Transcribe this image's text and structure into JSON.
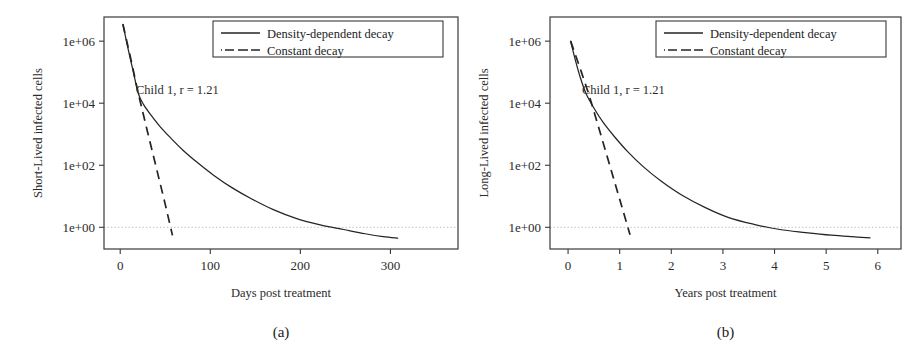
{
  "figure": {
    "background": "#ffffff",
    "ink": "#242424",
    "refline_color": "#b9b9b9"
  },
  "chart_data": [
    {
      "type": "line",
      "panel": "a",
      "caption": "(a)",
      "title": "",
      "xlabel": "Days post treatment",
      "ylabel": "Short-Lived infected cells",
      "annotation": "Child 1, r = 1.21",
      "yscale": "log",
      "ylim": [
        0.2,
        6000000
      ],
      "xlim": [
        -18,
        375
      ],
      "yticks": [
        1,
        100,
        10000,
        1000000
      ],
      "yticklabels": [
        "1e+00",
        "1e+02",
        "1e+04",
        "1e+06"
      ],
      "xticks": [
        0,
        100,
        200,
        300
      ],
      "xticklabels": [
        "0",
        "100",
        "200",
        "300"
      ],
      "grid": false,
      "reference_line_y": 1,
      "legend": {
        "position": "top-right",
        "entries": [
          {
            "label": "Density-dependent decay",
            "style": "solid"
          },
          {
            "label": "Constant decay",
            "style": "dashdot"
          }
        ]
      },
      "series": [
        {
          "name": "Density-dependent decay",
          "style": "solid",
          "x": [
            3,
            8,
            14,
            20,
            26,
            34,
            44,
            56,
            70,
            86,
            104,
            124,
            146,
            170,
            196,
            222,
            248,
            272,
            292,
            308
          ],
          "y": [
            3500000,
            700000,
            120000,
            21000,
            9000,
            4200,
            1800,
            760,
            300,
            120,
            47,
            19,
            8.2,
            3.7,
            1.9,
            1.2,
            0.85,
            0.62,
            0.5,
            0.45
          ]
        },
        {
          "name": "Constant decay",
          "style": "dashed",
          "x": [
            3,
            12,
            20,
            30,
            40,
            50,
            58
          ],
          "y": [
            3500000,
            250000,
            21000,
            1300,
            85,
            5.5,
            0.55
          ]
        }
      ]
    },
    {
      "type": "line",
      "panel": "b",
      "caption": "(b)",
      "title": "",
      "xlabel": "Years post treatment",
      "ylabel": "Long-Lived infected cells",
      "annotation": "Child 1, r = 1.21",
      "yscale": "log",
      "ylim": [
        0.2,
        6000000
      ],
      "xlim": [
        -0.35,
        6.45
      ],
      "yticks": [
        1,
        100,
        10000,
        1000000
      ],
      "yticklabels": [
        "1e+00",
        "1e+02",
        "1e+04",
        "1e+06"
      ],
      "xticks": [
        0,
        1,
        2,
        3,
        4,
        5,
        6
      ],
      "xticklabels": [
        "0",
        "1",
        "2",
        "3",
        "4",
        "5",
        "6"
      ],
      "grid": false,
      "reference_line_y": 1,
      "legend": {
        "position": "top-right",
        "entries": [
          {
            "label": "Density-dependent decay",
            "style": "solid"
          },
          {
            "label": "Constant decay",
            "style": "dashdot"
          }
        ]
      },
      "series": [
        {
          "name": "Density-dependent decay",
          "style": "solid",
          "x": [
            0.05,
            0.14,
            0.24,
            0.35,
            0.5,
            0.68,
            0.9,
            1.15,
            1.45,
            1.8,
            2.2,
            2.65,
            3.1,
            3.6,
            4.1,
            4.6,
            5.1,
            5.5,
            5.85
          ],
          "y": [
            1000000,
            250000,
            65000,
            20000,
            7000,
            2400,
            830,
            280,
            92,
            31,
            11,
            4.4,
            2.1,
            1.25,
            0.85,
            0.68,
            0.56,
            0.5,
            0.46
          ]
        },
        {
          "name": "Constant decay",
          "style": "dashed",
          "x": [
            0.05,
            0.25,
            0.4,
            0.6,
            0.8,
            1.0,
            1.2
          ],
          "y": [
            1000000,
            110000,
            20000,
            1500,
            110,
            8,
            0.58
          ]
        }
      ]
    }
  ]
}
